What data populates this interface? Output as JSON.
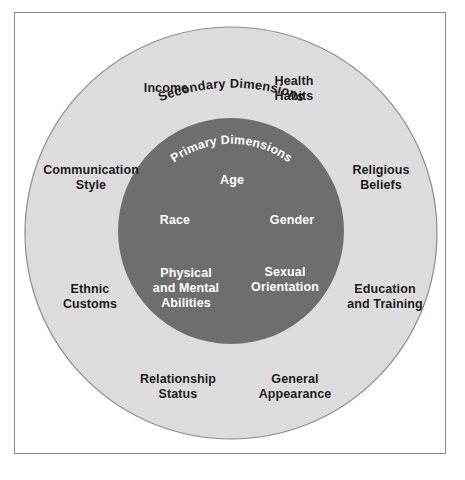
{
  "figure": {
    "type": "concentric-circle-diagram",
    "frame_border_color": "#8c8c8c",
    "background_color": "#ffffff"
  },
  "rings": {
    "outer": {
      "arc_title": "Secondary Dimensions",
      "fill_color": "#dcdcdc",
      "stroke_color": "#8c8c8c",
      "text_color": "#1c1c1c",
      "labels": [
        {
          "id": "income",
          "text": "Income"
        },
        {
          "id": "health-habits",
          "text": "Health\nHabits"
        },
        {
          "id": "communication-style",
          "text": "Communication\nStyle"
        },
        {
          "id": "religious-beliefs",
          "text": "Religious\nBeliefs"
        },
        {
          "id": "ethnic-customs",
          "text": "Ethnic\nCustoms"
        },
        {
          "id": "education-and-training",
          "text": "Education\nand Training"
        },
        {
          "id": "relationship-status",
          "text": "Relationship\nStatus"
        },
        {
          "id": "general-appearance",
          "text": "General\nAppearance"
        }
      ]
    },
    "inner": {
      "arc_title": "Primary Dimensions",
      "fill_color": "#6e6e6e",
      "text_color": "#ffffff",
      "labels": [
        {
          "id": "age",
          "text": "Age"
        },
        {
          "id": "race",
          "text": "Race"
        },
        {
          "id": "gender",
          "text": "Gender"
        },
        {
          "id": "physical-and-mental-abilities",
          "text": "Physical\nand Mental\nAbilities"
        },
        {
          "id": "sexual-orientation",
          "text": "Sexual\nOrientation"
        }
      ]
    }
  }
}
